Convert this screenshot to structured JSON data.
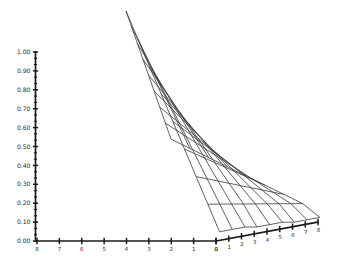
{
  "chart_data": {
    "type": "line",
    "render": "3d-wireframe-surface",
    "title": "",
    "subtitle": "",
    "xlabel": "",
    "ylabel": "",
    "zlabel": "",
    "grid": true,
    "legend": null,
    "background_color": "#ffffff",
    "mesh_color": "#3a3a3a",
    "axis_color": "#1a1a1a",
    "mesh_line_width": 0.8,
    "axes": {
      "z": {
        "label": "",
        "min": 0.0,
        "max": 1.0,
        "step": 0.1,
        "minor_ticks_per_major": 2,
        "tick_labels": [
          "1.00",
          "0.90",
          "0.80",
          "0.70",
          "0.60",
          "0.50",
          "0.40",
          "0.30",
          "0.20",
          "0.10",
          "0.00"
        ],
        "tick_values": [
          1.0,
          0.9,
          0.8,
          0.7,
          0.6,
          0.5,
          0.4,
          0.3,
          0.2,
          0.1,
          0.0
        ],
        "position": "left-vertical"
      },
      "x": {
        "label": "",
        "min": 0,
        "max": 8,
        "step": 1,
        "tick_labels": [
          "8",
          "7",
          "6",
          "5",
          "4",
          "3",
          "2",
          "1",
          "0"
        ],
        "tick_values": [
          8,
          7,
          6,
          5,
          4,
          3,
          2,
          1,
          0
        ],
        "direction": "descending-left-to-right",
        "position": "bottom-left"
      },
      "y": {
        "label": "",
        "min": 0,
        "max": 8,
        "step": 1,
        "tick_labels": [
          "0",
          "1",
          "2",
          "3",
          "4",
          "5",
          "6",
          "7",
          "8"
        ],
        "tick_values": [
          0,
          1,
          2,
          3,
          4,
          5,
          6,
          7,
          8
        ],
        "direction": "ascending-left-to-right",
        "position": "bottom-right"
      }
    },
    "surface": {
      "nx": 8,
      "ny": 8,
      "x_values": [
        0,
        1,
        2,
        3,
        4,
        5,
        6,
        7,
        8
      ],
      "y_values": [
        0,
        1,
        2,
        3,
        4,
        5,
        6,
        7,
        8
      ],
      "z_grid": [
        [
          1.0,
          0.92,
          0.84,
          0.76,
          0.68,
          0.6,
          0.52,
          0.44,
          0.36
        ],
        [
          0.88,
          0.81,
          0.74,
          0.67,
          0.6,
          0.53,
          0.46,
          0.39,
          0.32
        ],
        [
          0.76,
          0.7,
          0.64,
          0.58,
          0.52,
          0.46,
          0.4,
          0.34,
          0.28
        ],
        [
          0.64,
          0.59,
          0.54,
          0.49,
          0.44,
          0.39,
          0.34,
          0.29,
          0.24
        ],
        [
          0.52,
          0.48,
          0.44,
          0.4,
          0.36,
          0.32,
          0.28,
          0.24,
          0.2
        ],
        [
          0.4,
          0.37,
          0.34,
          0.31,
          0.28,
          0.25,
          0.22,
          0.19,
          0.16
        ],
        [
          0.28,
          0.26,
          0.24,
          0.22,
          0.2,
          0.18,
          0.16,
          0.14,
          0.12
        ],
        [
          0.16,
          0.15,
          0.14,
          0.13,
          0.12,
          0.11,
          0.1,
          0.09,
          0.08
        ],
        [
          0.04,
          0.04,
          0.04,
          0.03,
          0.03,
          0.03,
          0.02,
          0.02,
          0.02
        ]
      ],
      "peak_value": 1.0,
      "min_value": 0.02
    },
    "projection": {
      "origin_px": [
        216,
        241
      ],
      "x_axis_end_px": [
        37,
        241
      ],
      "y_axis_end_px": [
        318,
        222
      ],
      "peak_px": [
        126,
        11
      ],
      "far_corner_px": [
        318,
        146
      ]
    }
  }
}
